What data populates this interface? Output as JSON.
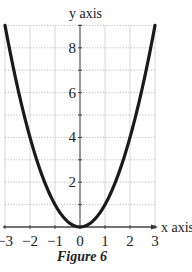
{
  "chart_data": {
    "type": "line",
    "title": "",
    "caption": "Figure 6",
    "xlabel": "x axis",
    "ylabel": "y axis",
    "xlim": [
      -3,
      3
    ],
    "ylim": [
      0,
      9
    ],
    "grid": true,
    "legend": null,
    "x_ticks": [
      -3,
      -2,
      -1,
      0,
      1,
      2,
      3
    ],
    "x_tick_labels": [
      "−3",
      "−2",
      "−1",
      "0",
      "1",
      "2",
      "3"
    ],
    "y_ticks": [
      2,
      4,
      6,
      8
    ],
    "y_tick_labels": [
      "2",
      "4",
      "6",
      "8"
    ],
    "series": [
      {
        "name": "y = x^2",
        "x": [
          -3,
          -2.5,
          -2,
          -1.5,
          -1,
          -0.5,
          0,
          0.5,
          1,
          1.5,
          2,
          2.5,
          3
        ],
        "values": [
          9,
          6.25,
          4,
          2.25,
          1,
          0.25,
          0,
          0.25,
          1,
          2.25,
          4,
          6.25,
          9
        ],
        "color": "#1a1a1a"
      }
    ]
  },
  "figure": {
    "caption": "Figure 6",
    "x_axis_label": "x axis",
    "y_axis_label": "y axis"
  }
}
